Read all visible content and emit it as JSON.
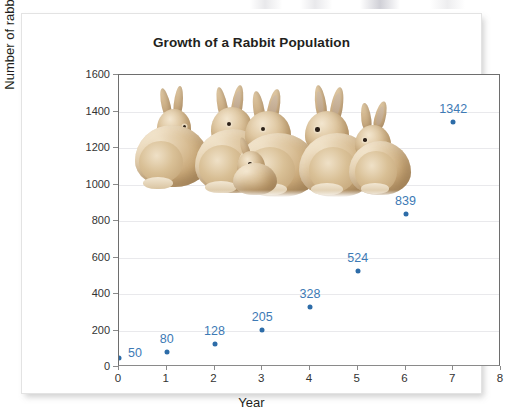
{
  "chart_data": {
    "type": "scatter",
    "title": "Growth of a Rabbit Population",
    "xlabel": "Year",
    "ylabel": "Number of rabbits",
    "x": [
      0,
      1,
      2,
      3,
      4,
      5,
      6,
      7
    ],
    "values": [
      50,
      80,
      128,
      205,
      328,
      524,
      839,
      1342
    ],
    "point_labels": [
      "50",
      "80",
      "128",
      "205",
      "328",
      "524",
      "839",
      "1342"
    ],
    "xlim": [
      0,
      8
    ],
    "ylim": [
      0,
      1600
    ],
    "xticks": [
      "0",
      "1",
      "2",
      "3",
      "4",
      "5",
      "6",
      "7",
      "8"
    ],
    "yticks": [
      "0",
      "200",
      "400",
      "600",
      "800",
      "1000",
      "1200",
      "1400",
      "1600"
    ],
    "grid": "horizontal",
    "legend": "none",
    "series_color": "#2d6ca8",
    "label_color": "#3d7ab5"
  },
  "overlay": {
    "image_name": "group-of-rabbits-photo",
    "description": "Photograph of six tan rabbits huddled together"
  }
}
